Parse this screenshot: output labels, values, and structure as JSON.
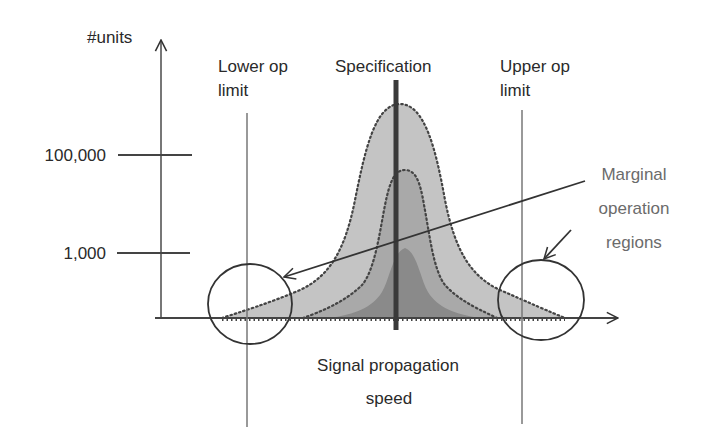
{
  "diagram": {
    "y_axis": {
      "label": "#units",
      "ticks": [
        {
          "label": "100,000"
        },
        {
          "label": "1,000"
        }
      ]
    },
    "x_axis": {
      "label_line1": "Signal propagation",
      "label_line2": "speed"
    },
    "lower_limit": {
      "line1": "Lower op",
      "line2": "limit"
    },
    "specification": {
      "label": "Specification"
    },
    "upper_limit": {
      "line1": "Upper op",
      "line2": "limit"
    },
    "annotation": {
      "line1": "Marginal",
      "line2": "operation",
      "line3": "regions"
    },
    "distributions": [
      {
        "name": "outer-distribution",
        "fill": "#c4c4c4"
      },
      {
        "name": "middle-distribution",
        "fill": "#a9a9a9"
      },
      {
        "name": "inner-distribution",
        "fill": "#8a8a8a"
      }
    ],
    "colors": {
      "axis": "#555555",
      "spec_line": "#3a3a3a",
      "limit_line": "#777777",
      "text": "#2a2a2a",
      "annotation_text": "#6b6b6b"
    }
  }
}
